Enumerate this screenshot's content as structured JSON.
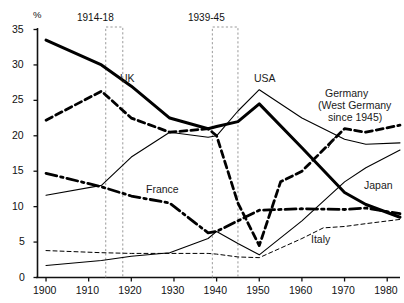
{
  "chart_data": {
    "type": "line",
    "title": "",
    "xlabel": "",
    "ylabel": "%",
    "xlim": [
      1898,
      1983
    ],
    "ylim": [
      0,
      35
    ],
    "yticks": [
      0,
      5,
      10,
      15,
      20,
      25,
      30,
      35
    ],
    "xticks": [
      1900,
      1910,
      1920,
      1930,
      1940,
      1950,
      1960,
      1970,
      1980
    ],
    "grid": false,
    "legend": "inline-labels",
    "annotations": [
      {
        "text": "1914-18",
        "type": "war-band",
        "x_start": 1914,
        "x_end": 1918
      },
      {
        "text": "1939-45",
        "type": "war-band",
        "x_start": 1939,
        "x_end": 1945
      }
    ],
    "series": [
      {
        "name": "UK",
        "style": "thick-solid",
        "label": "UK",
        "x": [
          1900,
          1913,
          1920,
          1929,
          1938,
          1940,
          1945,
          1950,
          1960,
          1970,
          1975,
          1983
        ],
        "values": [
          33.5,
          30.0,
          27.0,
          22.5,
          21.0,
          21.3,
          22.0,
          24.5,
          18.3,
          12.0,
          10.3,
          8.5
        ]
      },
      {
        "name": "Germany (West Germany since 1945)",
        "style": "thick-dashed",
        "label": "Germany (West Germany since 1945)",
        "x": [
          1900,
          1913,
          1920,
          1929,
          1938,
          1940,
          1945,
          1950,
          1955,
          1960,
          1970,
          1975,
          1983
        ],
        "values": [
          22.2,
          26.3,
          22.5,
          20.5,
          21.0,
          20.0,
          10.5,
          4.5,
          13.5,
          15.0,
          21.0,
          20.5,
          21.5
        ]
      },
      {
        "name": "USA",
        "style": "thin-solid",
        "label": "USA",
        "x": [
          1900,
          1913,
          1920,
          1929,
          1938,
          1940,
          1945,
          1950,
          1960,
          1970,
          1975,
          1983
        ],
        "values": [
          11.6,
          13.0,
          17.0,
          20.5,
          19.8,
          20.0,
          23.5,
          26.5,
          22.5,
          19.5,
          18.8,
          19.0
        ]
      },
      {
        "name": "France",
        "style": "thick-dash-dot",
        "label": "France",
        "x": [
          1900,
          1913,
          1920,
          1929,
          1938,
          1940,
          1945,
          1950,
          1960,
          1970,
          1975,
          1983
        ],
        "values": [
          14.7,
          12.8,
          11.5,
          10.5,
          6.3,
          6.5,
          8.0,
          9.5,
          9.7,
          9.6,
          9.8,
          9.0
        ]
      },
      {
        "name": "Japan",
        "style": "thin-solid-2",
        "label": "Japan",
        "x": [
          1900,
          1913,
          1920,
          1929,
          1938,
          1940,
          1945,
          1950,
          1960,
          1970,
          1975,
          1983
        ],
        "values": [
          1.7,
          2.4,
          3.0,
          3.5,
          5.5,
          6.5,
          4.8,
          3.2,
          8.0,
          13.5,
          15.5,
          18.0
        ]
      },
      {
        "name": "Italy",
        "style": "thin-dashed",
        "label": "Italy",
        "x": [
          1900,
          1913,
          1920,
          1929,
          1938,
          1940,
          1945,
          1950,
          1960,
          1965,
          1970,
          1975,
          1983
        ],
        "values": [
          3.8,
          3.5,
          3.4,
          3.4,
          3.4,
          3.3,
          2.9,
          2.8,
          5.5,
          7.0,
          7.2,
          7.6,
          8.2
        ]
      }
    ]
  },
  "axes": {
    "y_unit": "%",
    "y_tick_labels": [
      "0",
      "5",
      "10",
      "15",
      "20",
      "25",
      "30",
      "35"
    ],
    "x_tick_labels": [
      "1900",
      "1910",
      "1920",
      "1930",
      "1940",
      "1950",
      "1960",
      "1970",
      "1980"
    ]
  },
  "series_labels": {
    "uk": "UK",
    "usa": "USA",
    "germany_line1": "Germany",
    "germany_line2": "(West Germany",
    "germany_line3": "since 1945)",
    "france": "France",
    "japan": "Japan",
    "italy": "Italy"
  },
  "war_bands": {
    "wwi": "1914-18",
    "wwii": "1939-45"
  }
}
